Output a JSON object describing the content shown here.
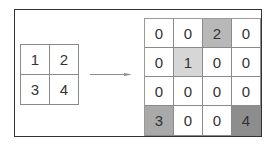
{
  "diagram": {
    "title": "",
    "input_grid": {
      "rows": 2,
      "cols": 2,
      "cells": [
        {
          "value": "1",
          "fill": "#ffffff"
        },
        {
          "value": "2",
          "fill": "#ffffff"
        },
        {
          "value": "3",
          "fill": "#ffffff"
        },
        {
          "value": "4",
          "fill": "#ffffff"
        }
      ]
    },
    "arrow": {
      "direction": "right",
      "color": "#8c8c8c"
    },
    "output_grid": {
      "rows": 4,
      "cols": 4,
      "cells": [
        {
          "value": "0",
          "fill": "#ffffff"
        },
        {
          "value": "0",
          "fill": "#ffffff"
        },
        {
          "value": "2",
          "fill": "#b8b8b8"
        },
        {
          "value": "0",
          "fill": "#ffffff"
        },
        {
          "value": "0",
          "fill": "#ffffff"
        },
        {
          "value": "1",
          "fill": "#d6d6d6"
        },
        {
          "value": "0",
          "fill": "#ffffff"
        },
        {
          "value": "0",
          "fill": "#ffffff"
        },
        {
          "value": "0",
          "fill": "#ffffff"
        },
        {
          "value": "0",
          "fill": "#ffffff"
        },
        {
          "value": "0",
          "fill": "#ffffff"
        },
        {
          "value": "0",
          "fill": "#ffffff"
        },
        {
          "value": "3",
          "fill": "#a9a9a9"
        },
        {
          "value": "0",
          "fill": "#ffffff"
        },
        {
          "value": "0",
          "fill": "#ffffff"
        },
        {
          "value": "4",
          "fill": "#8d8d8d"
        }
      ]
    }
  }
}
